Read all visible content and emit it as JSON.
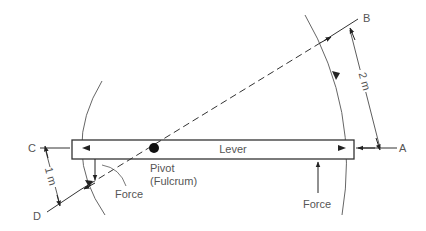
{
  "diagram": {
    "labels": {
      "lever": "Lever",
      "pivot_line1": "Pivot",
      "pivot_line2": "(Fulcrum)",
      "force_left": "Force",
      "force_right": "Force",
      "point_a": "A",
      "point_b": "B",
      "point_c": "C",
      "point_d": "D",
      "dim_long": "2 m",
      "dim_short": "1 m"
    },
    "colors": {
      "line": "#333333",
      "arc": "#555555",
      "text": "#555555",
      "background": "#ffffff"
    }
  }
}
